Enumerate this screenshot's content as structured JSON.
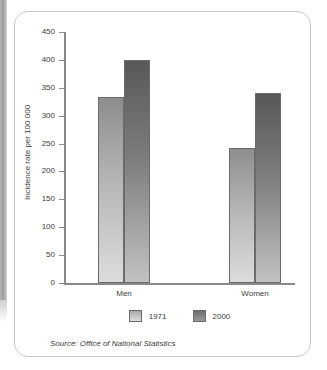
{
  "chart_data": {
    "type": "bar",
    "title": "",
    "xlabel": "",
    "ylabel": "Incidence rate per 100 000",
    "ylim": [
      0,
      450
    ],
    "yticks": [
      0,
      50,
      100,
      150,
      200,
      250,
      300,
      350,
      400,
      450
    ],
    "categories": [
      "Men",
      "Women"
    ],
    "grid": false,
    "legend_position": "bottom",
    "series": [
      {
        "name": "1971",
        "values": [
          333,
          242
        ],
        "color": "#b5b5b5"
      },
      {
        "name": "2000",
        "values": [
          400,
          340
        ],
        "color": "#7e7e7e"
      }
    ],
    "source": "Source: Office of National Statistics"
  }
}
